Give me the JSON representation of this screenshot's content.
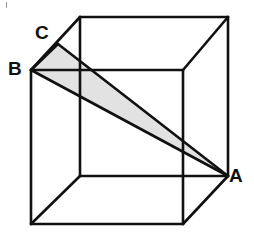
{
  "figure": {
    "background_color": "#ffffff",
    "stroke_color": "#111111",
    "shade_color": "#e2e2e2",
    "stroke_width": 2.6
  },
  "labels": {
    "a": "A",
    "b": "B",
    "c": "C"
  },
  "chart_data": {
    "type": "diagram",
    "projection": "oblique",
    "vertices": {
      "front_top_left": [
        31,
        70
      ],
      "front_top_right": [
        183,
        70
      ],
      "front_bottom_right": [
        183,
        224
      ],
      "front_bottom_left": [
        31,
        224
      ],
      "back_top_left": [
        80,
        17
      ],
      "back_top_right": [
        228,
        17
      ],
      "back_bottom_right": [
        228,
        176
      ],
      "back_bottom_left": [
        80,
        176
      ]
    },
    "named_points": [
      {
        "label": "A",
        "vertex": "back_bottom_right",
        "x": 228,
        "y": 176
      },
      {
        "label": "B",
        "vertex": "front_top_left",
        "x": 31,
        "y": 70
      },
      {
        "label": "C",
        "on_edge": "front_top_left-back_top_left",
        "x": 58,
        "y": 44
      }
    ],
    "triangle": {
      "points": [
        "A",
        "B",
        "C"
      ],
      "filled": true,
      "fill": "#e2e2e2"
    },
    "edges_solid": [
      [
        "front_top_left",
        "front_top_right"
      ],
      [
        "front_top_right",
        "front_bottom_right"
      ],
      [
        "front_bottom_right",
        "front_bottom_left"
      ],
      [
        "front_bottom_left",
        "front_top_left"
      ],
      [
        "back_top_left",
        "back_top_right"
      ],
      [
        "back_top_right",
        "back_bottom_right"
      ],
      [
        "back_bottom_right",
        "back_bottom_left"
      ],
      [
        "back_bottom_left",
        "back_top_left"
      ],
      [
        "front_top_left",
        "back_top_left"
      ],
      [
        "front_top_right",
        "back_top_right"
      ],
      [
        "front_bottom_right",
        "back_bottom_right"
      ],
      [
        "front_bottom_left",
        "back_bottom_left"
      ]
    ]
  }
}
